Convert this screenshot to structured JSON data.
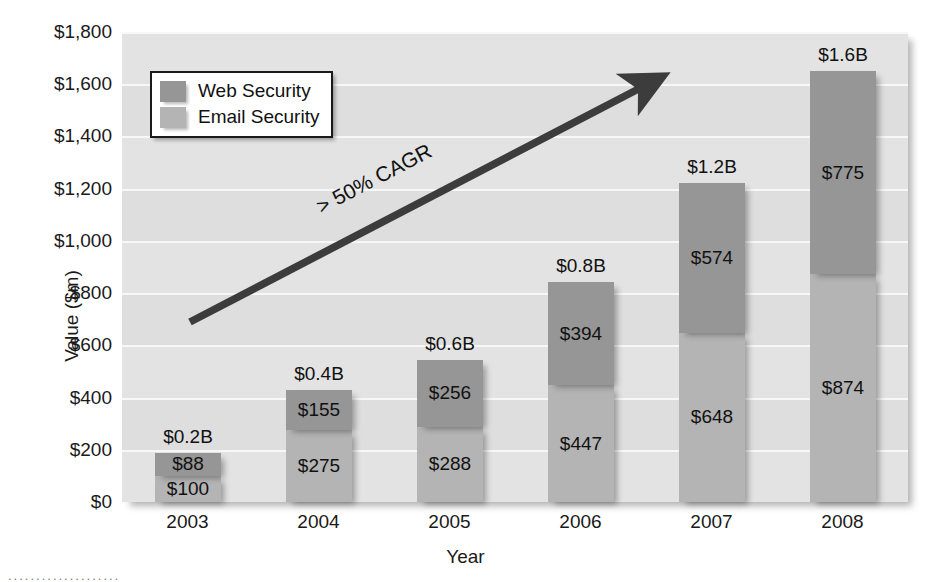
{
  "chart_data": {
    "type": "bar",
    "subtype": "stacked-bar",
    "title": "",
    "xlabel": "Year",
    "ylabel": "Value ($m)",
    "categories": [
      "2003",
      "2004",
      "2005",
      "2006",
      "2007",
      "2008"
    ],
    "series": [
      {
        "name": "Web Security",
        "color": "#969696",
        "values": [
          88,
          155,
          256,
          394,
          574,
          775
        ]
      },
      {
        "name": "Email Security",
        "color": "#b4b4b4",
        "values": [
          100,
          275,
          288,
          447,
          648,
          874
        ]
      }
    ],
    "series_labels": {
      "web": [
        "$88",
        "$155",
        "$256",
        "$394",
        "$574",
        "$775"
      ],
      "email": [
        "$100",
        "$275",
        "$288",
        "$447",
        "$648",
        "$874"
      ]
    },
    "totals": [
      188,
      430,
      544,
      841,
      1222,
      1649
    ],
    "total_labels": [
      "$0.2B",
      "$0.4B",
      "$0.6B",
      "$0.8B",
      "$1.2B",
      "$1.6B"
    ],
    "ylim": [
      0,
      1800
    ],
    "ytick_values": [
      0,
      200,
      400,
      600,
      800,
      1000,
      1200,
      1400,
      1600,
      1800
    ],
    "ytick_labels": [
      "$0",
      "$200",
      "$400",
      "$600",
      "$800",
      "$1,000",
      "$1,200",
      "$1,400",
      "$1,600",
      "$1,800"
    ],
    "grid": true,
    "legend_position": "top-left",
    "annotations": [
      {
        "name": "cagr-arrow",
        "text": "> 50% CAGR",
        "arrow_from_year": "2003",
        "arrow_to_year": "2008",
        "style": "diagonal-arrow"
      }
    ],
    "plot_background": "#e3e3e3"
  },
  "legend": {
    "items": [
      {
        "label": "Web Security",
        "color": "#969696"
      },
      {
        "label": "Email Security",
        "color": "#b4b4b4"
      }
    ]
  },
  "axes": {
    "y_title": "Value ($m)",
    "x_title": "Year"
  },
  "annotation": {
    "cagr": "> 50% CAGR"
  },
  "artifacts": {
    "dots": "...................."
  }
}
